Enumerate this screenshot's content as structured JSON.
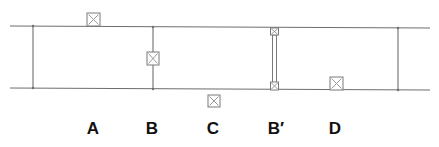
{
  "diagram": {
    "type": "schematic",
    "colors": {
      "line": "#6e6e6e",
      "box_stroke": "#7a7a7a",
      "box_cross": "#9a9a9a",
      "label": "#111111",
      "background": "#ffffff"
    },
    "labels": [
      {
        "id": "A",
        "text": "A",
        "x": 93
      },
      {
        "id": "B",
        "text": "B",
        "x": 152
      },
      {
        "id": "C",
        "text": "C",
        "x": 213
      },
      {
        "id": "B-prime",
        "text": "B′",
        "x": 275
      },
      {
        "id": "D",
        "text": "D",
        "x": 335
      }
    ],
    "elements": [
      {
        "label": "A",
        "kind": "box",
        "position": "on top line, outside (above)"
      },
      {
        "label": "B",
        "kind": "box",
        "position": "on vertical partition, midway"
      },
      {
        "label": "C",
        "kind": "box",
        "position": "below bottom line, outside"
      },
      {
        "label": "B′",
        "kind": "double rod with boxes at both ends",
        "position": "spanning between top and bottom lines"
      },
      {
        "label": "D",
        "kind": "box",
        "position": "on bottom line, inside (above)"
      }
    ]
  }
}
